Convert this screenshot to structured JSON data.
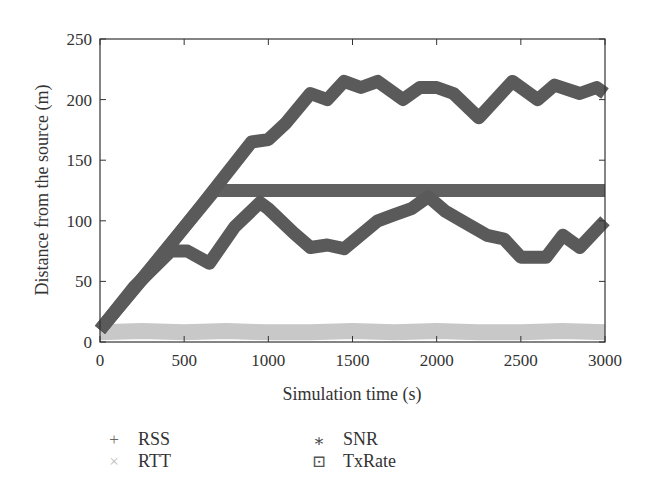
{
  "chart_data": {
    "type": "scatter",
    "title": "",
    "xlabel": "Simulation time (s)",
    "ylabel": "Distance from the source (m)",
    "xlim": [
      0,
      3000
    ],
    "ylim": [
      0,
      250
    ],
    "xticks": [
      0,
      500,
      1000,
      1500,
      2000,
      2500,
      3000
    ],
    "yticks": [
      0,
      50,
      100,
      150,
      200,
      250
    ],
    "grid": false,
    "legend_position": "below",
    "series": [
      {
        "name": "RSS",
        "marker": "+",
        "color": "#5a5a5a",
        "x": [
          0,
          200,
          420,
          520,
          650,
          800,
          950,
          1000,
          1150,
          1250,
          1350,
          1450,
          1650,
          1750,
          1850,
          1950,
          2050,
          2150,
          2300,
          2400,
          2500,
          2650,
          2750,
          2850,
          3000
        ],
        "y": [
          10,
          45,
          75,
          75,
          65,
          95,
          115,
          110,
          90,
          78,
          80,
          77,
          100,
          105,
          110,
          120,
          108,
          100,
          88,
          85,
          70,
          70,
          88,
          78,
          100
        ]
      },
      {
        "name": "RTT",
        "marker": "x",
        "color": "#c8c8c8",
        "x": [
          0,
          250,
          500,
          750,
          1000,
          1250,
          1500,
          1750,
          2000,
          2250,
          2500,
          2750,
          3000
        ],
        "y": [
          8,
          9,
          8,
          9,
          8,
          8,
          9,
          8,
          9,
          8,
          8,
          9,
          8
        ]
      },
      {
        "name": "SNR",
        "marker": "*",
        "color": "#5a5a5a",
        "x": [
          0,
          300,
          600,
          900,
          1000,
          1100,
          1250,
          1350,
          1450,
          1550,
          1650,
          1750,
          1800,
          1900,
          2000,
          2100,
          2250,
          2350,
          2450,
          2600,
          2700,
          2850,
          2950,
          3000
        ],
        "y": [
          10,
          60,
          112,
          165,
          167,
          180,
          205,
          200,
          215,
          210,
          215,
          205,
          200,
          210,
          210,
          205,
          185,
          200,
          215,
          200,
          212,
          205,
          210,
          205
        ]
      },
      {
        "name": "TxRate",
        "marker": "square-dot",
        "color": "#606060",
        "x": [
          0,
          680,
          1000,
          1500,
          2000,
          2500,
          3000
        ],
        "y": [
          10,
          125,
          125,
          125,
          125,
          125,
          125
        ]
      }
    ]
  },
  "legend": {
    "items": [
      {
        "symbol": "+",
        "label": "RSS"
      },
      {
        "symbol": "×",
        "label": "RTT"
      },
      {
        "symbol": "⁎",
        "label": "SNR"
      },
      {
        "symbol": "⊡",
        "label": "TxRate"
      }
    ]
  }
}
